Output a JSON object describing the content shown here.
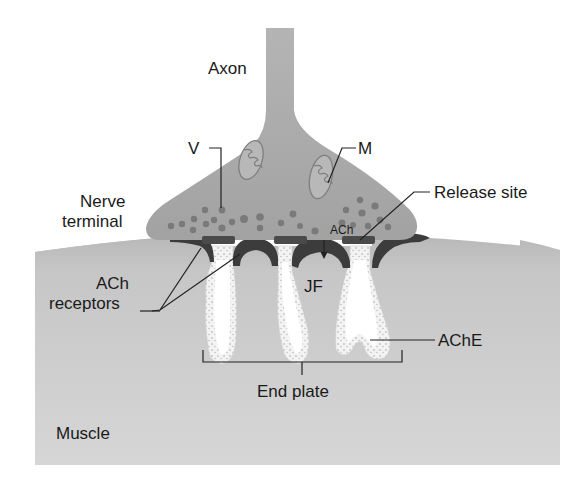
{
  "diagram": {
    "colors": {
      "background": "#ffffff",
      "nerve_fill": "#a9a9a9",
      "vesicle_fill": "#7a7a7a",
      "release_site_fill": "#4a4a4a",
      "muscle_fill": "#c8c8c8",
      "receptor_cap_fill": "#3c3c3c",
      "fold_fill": "#f4f4f4",
      "text": "#1a1a1a"
    },
    "labels": {
      "axon": "Axon",
      "vesicle": "V",
      "mitochondrion": "M",
      "nerve_terminal_line1": "Nerve",
      "nerve_terminal_line2": "terminal",
      "release_site": "Release site",
      "ach": "ACh",
      "ach_receptors_line1": "ACh",
      "ach_receptors_line2": "receptors",
      "junctional_fold": "JF",
      "ache": "AChE",
      "end_plate": "End plate",
      "muscle": "Muscle"
    }
  }
}
